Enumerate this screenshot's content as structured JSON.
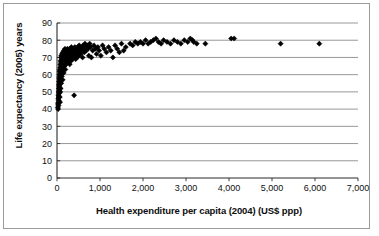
{
  "chart_data": {
    "type": "scatter",
    "title": "",
    "subtitle": "",
    "xlabel": "Health expenditure per capita (2004) (US$ ppp)",
    "ylabel": "Life expectancy (2005) years",
    "xlim": [
      0,
      7000
    ],
    "ylim": [
      0,
      90
    ],
    "xticks": [
      0,
      1000,
      2000,
      3000,
      4000,
      5000,
      6000,
      7000
    ],
    "xticklabels": [
      "0",
      "1,000",
      "2,000",
      "3,000",
      "4,000",
      "5,000",
      "6,000",
      "7,000"
    ],
    "yticks": [
      0,
      10,
      20,
      30,
      40,
      50,
      60,
      70,
      80,
      90
    ],
    "yticklabels": [
      "0",
      "10",
      "20",
      "30",
      "40",
      "50",
      "60",
      "70",
      "80",
      "90"
    ],
    "grid": "horizontal",
    "legend": "none",
    "marker": "diamond",
    "marker_color": "#000000",
    "marker_size": 2.6,
    "series": [
      {
        "name": "Countries",
        "points": [
          [
            18,
            41
          ],
          [
            22,
            43
          ],
          [
            25,
            40
          ],
          [
            28,
            46
          ],
          [
            30,
            44
          ],
          [
            32,
            48
          ],
          [
            34,
            42
          ],
          [
            36,
            50
          ],
          [
            38,
            47
          ],
          [
            40,
            52
          ],
          [
            42,
            45
          ],
          [
            44,
            54
          ],
          [
            46,
            49
          ],
          [
            48,
            56
          ],
          [
            50,
            51
          ],
          [
            52,
            58
          ],
          [
            54,
            53
          ],
          [
            56,
            60
          ],
          [
            58,
            55
          ],
          [
            60,
            62
          ],
          [
            62,
            57
          ],
          [
            64,
            47
          ],
          [
            66,
            59
          ],
          [
            68,
            63
          ],
          [
            70,
            44
          ],
          [
            72,
            61
          ],
          [
            74,
            64
          ],
          [
            76,
            50
          ],
          [
            78,
            66
          ],
          [
            80,
            58
          ],
          [
            82,
            68
          ],
          [
            85,
            52
          ],
          [
            88,
            65
          ],
          [
            90,
            70
          ],
          [
            92,
            60
          ],
          [
            95,
            67
          ],
          [
            98,
            55
          ],
          [
            100,
            71
          ],
          [
            104,
            63
          ],
          [
            108,
            69
          ],
          [
            112,
            59
          ],
          [
            116,
            72
          ],
          [
            120,
            66
          ],
          [
            124,
            62
          ],
          [
            128,
            70
          ],
          [
            132,
            57
          ],
          [
            136,
            73
          ],
          [
            140,
            68
          ],
          [
            145,
            64
          ],
          [
            150,
            71
          ],
          [
            155,
            61
          ],
          [
            160,
            74
          ],
          [
            165,
            67
          ],
          [
            170,
            72
          ],
          [
            175,
            65
          ],
          [
            180,
            70
          ],
          [
            185,
            75
          ],
          [
            190,
            69
          ],
          [
            195,
            63
          ],
          [
            200,
            73
          ],
          [
            205,
            71
          ],
          [
            210,
            66
          ],
          [
            215,
            74
          ],
          [
            220,
            68
          ],
          [
            228,
            72
          ],
          [
            235,
            70
          ],
          [
            242,
            75
          ],
          [
            250,
            67
          ],
          [
            258,
            73
          ],
          [
            265,
            71
          ],
          [
            272,
            69
          ],
          [
            280,
            74
          ],
          [
            288,
            72
          ],
          [
            295,
            66
          ],
          [
            302,
            75
          ],
          [
            310,
            70
          ],
          [
            318,
            73
          ],
          [
            326,
            68
          ],
          [
            334,
            76
          ],
          [
            342,
            71
          ],
          [
            350,
            74
          ],
          [
            358,
            69
          ],
          [
            366,
            72
          ],
          [
            374,
            75
          ],
          [
            382,
            70
          ],
          [
            390,
            73
          ],
          [
            398,
            48
          ],
          [
            406,
            71
          ],
          [
            415,
            76
          ],
          [
            424,
            74
          ],
          [
            432,
            69
          ],
          [
            440,
            72
          ],
          [
            450,
            75
          ],
          [
            460,
            73
          ],
          [
            470,
            70
          ],
          [
            480,
            76
          ],
          [
            492,
            74
          ],
          [
            504,
            71
          ],
          [
            516,
            77
          ],
          [
            528,
            73
          ],
          [
            540,
            75
          ],
          [
            552,
            72
          ],
          [
            566,
            76
          ],
          [
            580,
            74
          ],
          [
            594,
            70
          ],
          [
            608,
            77
          ],
          [
            622,
            75
          ],
          [
            636,
            73
          ],
          [
            650,
            78
          ],
          [
            665,
            76
          ],
          [
            680,
            74
          ],
          [
            700,
            77
          ],
          [
            720,
            75
          ],
          [
            740,
            71
          ],
          [
            760,
            78
          ],
          [
            780,
            76
          ],
          [
            800,
            70
          ],
          [
            830,
            74
          ],
          [
            860,
            77
          ],
          [
            890,
            75
          ],
          [
            920,
            72
          ],
          [
            950,
            76
          ],
          [
            980,
            74
          ],
          [
            1020,
            71
          ],
          [
            1060,
            77
          ],
          [
            1100,
            75
          ],
          [
            1150,
            73
          ],
          [
            1200,
            76
          ],
          [
            1250,
            74
          ],
          [
            1300,
            70
          ],
          [
            1350,
            77
          ],
          [
            1400,
            75
          ],
          [
            1450,
            73
          ],
          [
            1500,
            78
          ],
          [
            1550,
            74
          ],
          [
            1600,
            76
          ],
          [
            1700,
            78
          ],
          [
            1760,
            77
          ],
          [
            1820,
            79
          ],
          [
            1880,
            78
          ],
          [
            1940,
            79
          ],
          [
            2000,
            78
          ],
          [
            2060,
            80
          ],
          [
            2120,
            78
          ],
          [
            2180,
            79
          ],
          [
            2240,
            80
          ],
          [
            2300,
            81
          ],
          [
            2360,
            79
          ],
          [
            2420,
            78
          ],
          [
            2480,
            80
          ],
          [
            2560,
            79
          ],
          [
            2640,
            78
          ],
          [
            2720,
            80
          ],
          [
            2800,
            79
          ],
          [
            2880,
            78
          ],
          [
            2960,
            80
          ],
          [
            3040,
            79
          ],
          [
            3100,
            81
          ],
          [
            3150,
            80
          ],
          [
            3180,
            79
          ],
          [
            3250,
            78
          ],
          [
            3450,
            78
          ],
          [
            4050,
            81
          ],
          [
            4120,
            81
          ],
          [
            5200,
            78
          ],
          [
            6100,
            78
          ]
        ]
      }
    ]
  },
  "axes": {
    "plot_left_px": 57,
    "plot_right_px": 358,
    "plot_top_px": 23,
    "plot_bottom_px": 178
  }
}
